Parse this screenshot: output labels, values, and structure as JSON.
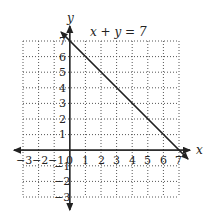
{
  "diagram": {
    "title": "x + y = 7",
    "x_axis_label": "x",
    "y_axis_label": "y",
    "x_ticks": [
      "−3",
      "−2",
      "−1",
      "0",
      "1",
      "2",
      "3",
      "4",
      "5",
      "6",
      "7"
    ],
    "y_ticks_positive": [
      "7",
      "6",
      "5",
      "4",
      "3",
      "2",
      "1"
    ],
    "y_ticks_negative": [
      "−1",
      "−2",
      "−3"
    ],
    "line": {
      "from": [
        0,
        7
      ],
      "to": [
        7,
        0
      ]
    },
    "grid": {
      "x_min": -3,
      "x_max": 7,
      "y_min": -3,
      "y_max": 7,
      "style": "dotted"
    }
  }
}
